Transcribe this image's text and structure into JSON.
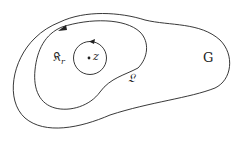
{
  "diagram": {
    "labels": {
      "region": "G",
      "contour": "𝔏",
      "circle": "𝔎",
      "circle_subscript": "r",
      "point": "z"
    },
    "colors": {
      "stroke": "#222222",
      "background": "#ffffff"
    }
  }
}
